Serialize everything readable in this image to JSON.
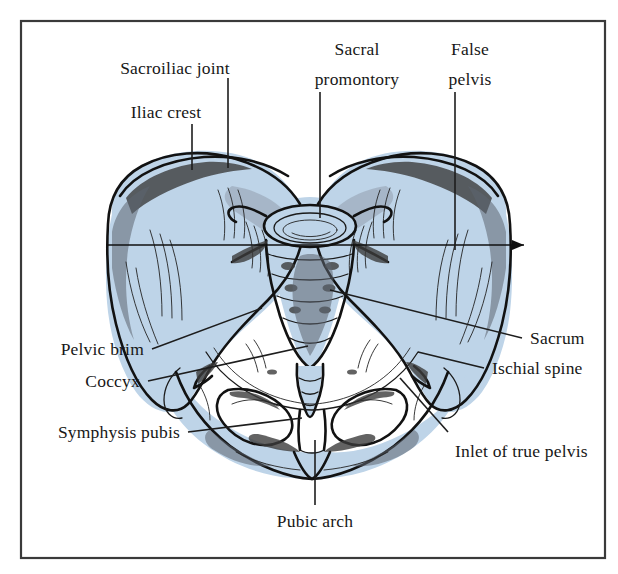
{
  "figure": {
    "frame_color": "#3a3a3a",
    "bone_fill_color": "#bed4e8",
    "ink_color": "#121212",
    "background_color": "#ffffff"
  },
  "labels": {
    "sacroiliac_joint": "Sacroiliac joint",
    "iliac_crest": "Iliac crest",
    "sacral_promontory_line1": "Sacral",
    "sacral_promontory_line2": "promontory",
    "false_pelvis_line1": "False",
    "false_pelvis_line2": "pelvis",
    "sacrum": "Sacrum",
    "ischial_spine": "Ischial spine",
    "inlet_of_true_pelvis": "Inlet of true pelvis",
    "pelvic_brim": "Pelvic brim",
    "coccyx": "Coccyx",
    "symphysis_pubis": "Symphysis pubis",
    "pubic_arch": "Pubic arch"
  }
}
